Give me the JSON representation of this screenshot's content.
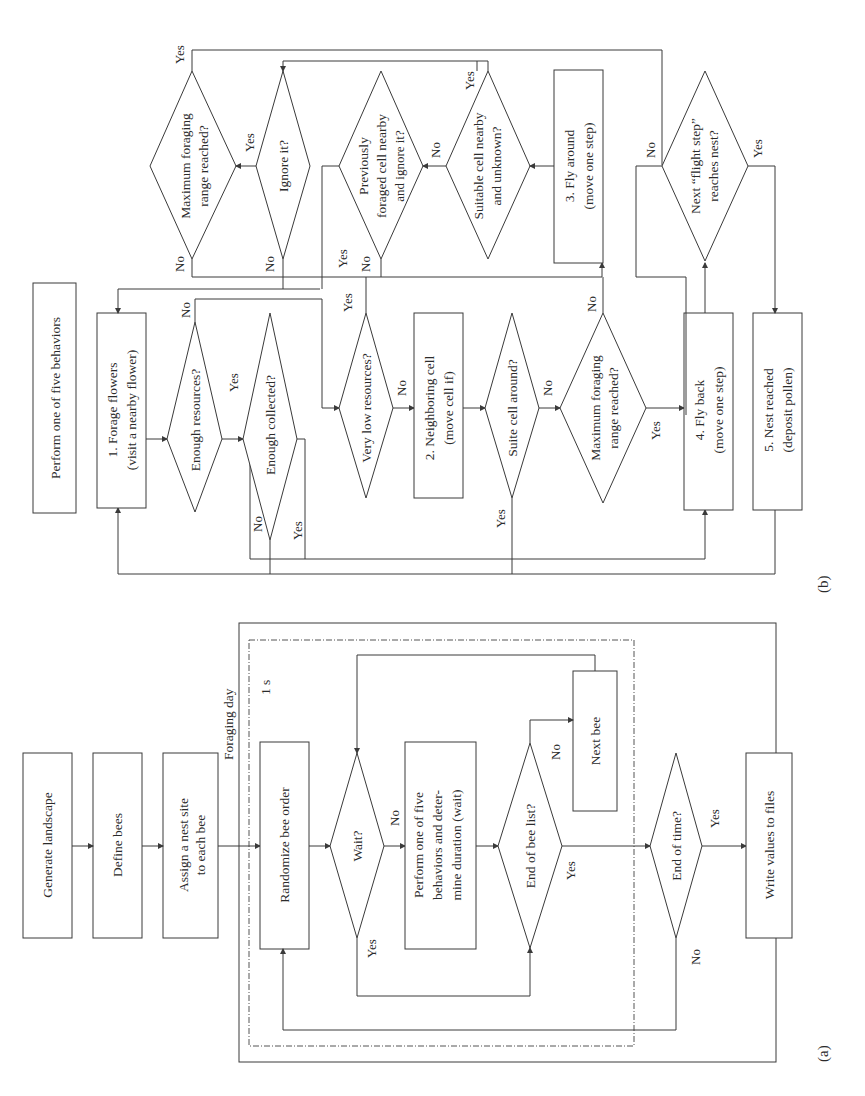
{
  "figure": {
    "orientation": "rotated 90 degrees counter-clockwise",
    "panel_labels": {
      "a": "(a)",
      "b": "(b)"
    }
  },
  "panel_a": {
    "container_outer": "Foraging day",
    "container_inner": "1 s",
    "nodes": {
      "generate_landscape": "Generate landscape",
      "define_bees": "Define bees",
      "assign_nest_1": "Assign a nest site",
      "assign_nest_2": "to each bee",
      "randomize": "Randomize bee order",
      "wait": "Wait?",
      "perform_1": "Perform one of five",
      "perform_2": "behaviors and deter-",
      "perform_3": "mine duration (wait)",
      "end_bee_list": "End of bee list?",
      "next_bee": "Next bee",
      "end_time": "End of time?",
      "write_values": "Write values to files"
    },
    "edge_labels": {
      "wait_no": "No",
      "wait_yes": "Yes",
      "ebl_no": "No",
      "ebl_yes": "Yes",
      "eot_yes": "Yes",
      "eot_no": "No"
    }
  },
  "panel_b": {
    "title": "Perform one of five behaviors",
    "nodes": {
      "forage_1": "1. Forage flowers",
      "forage_2": "(visit a nearby flower)",
      "enough_resources": "Enough resources?",
      "enough_collected": "Enough collected?",
      "very_low": "Very low resources?",
      "neighboring_1": "2. Neighboring cell",
      "neighboring_2": "(move cell if)",
      "suite_cell": "Suite cell around?",
      "max_range_lower_1": "Maximum foraging",
      "max_range_lower_2": "range reached?",
      "fly_back_1": "4. Fly back",
      "fly_back_2": "(move one step)",
      "nest_reached_1": "5. Nest reached",
      "nest_reached_2": "(deposit pollen)",
      "max_range_upper_1": "Maximum foraging",
      "max_range_upper_2": "range reached?",
      "ignore_it": "Ignore it?",
      "prev_foraged_1": "Previously",
      "prev_foraged_2": "foraged cell nearby",
      "prev_foraged_3": "and ignore it?",
      "suitable_1": "Suitable cell nearby",
      "suitable_2": "and unknown?",
      "fly_around_1": "3. Fly around",
      "fly_around_2": "(move one step)",
      "next_flight_1": "Next “flight step”",
      "next_flight_2": "reaches nest?"
    },
    "edge_labels": {
      "er_yes": "Yes",
      "er_no": "No",
      "ec_no": "No",
      "ec_yes": "Yes",
      "vl_yes": "Yes",
      "vl_no": "No",
      "sc_yes": "Yes",
      "sc_no": "No",
      "mrl_no": "No",
      "mrl_yes": "Yes",
      "mru_yes": "Yes",
      "mru_no": "No",
      "ig_yes": "Yes",
      "ig_no": "No",
      "pf_yes": "Yes",
      "pf_no": "No",
      "su_yes": "Yes",
      "su_no": "No",
      "nf_no": "No",
      "nf_yes": "Yes"
    }
  }
}
